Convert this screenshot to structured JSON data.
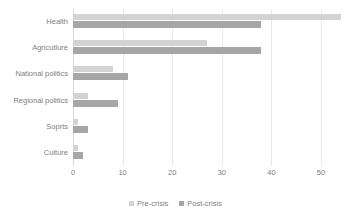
{
  "chart_data": {
    "type": "bar",
    "orientation": "horizontal",
    "title": "",
    "xlabel": "",
    "ylabel": "",
    "xlim": [
      0,
      50
    ],
    "xticks": [
      "0",
      "10",
      "20",
      "30",
      "40",
      "50"
    ],
    "grid": true,
    "legend_position": "bottom",
    "categories": [
      "Health",
      "Agricutlure",
      "National politics",
      "Regional politics",
      "Soprts",
      "Culture"
    ],
    "series": [
      {
        "name": "Pre-crisis",
        "color": "#d3d3d3",
        "values": [
          54,
          27,
          8,
          3,
          1,
          1
        ]
      },
      {
        "name": "Post-crisis",
        "color": "#a6a6a6",
        "values": [
          38,
          38,
          11,
          9,
          3,
          2
        ]
      }
    ]
  },
  "legend": {
    "items": [
      {
        "label": "Pre-crisis"
      },
      {
        "label": "Post-crisis"
      }
    ]
  },
  "colors": {
    "pre_crisis": "#d3d3d3",
    "post_crisis": "#a6a6a6",
    "gridline": "#e8e8e8",
    "text": "#808080",
    "background": "#ffffff"
  }
}
